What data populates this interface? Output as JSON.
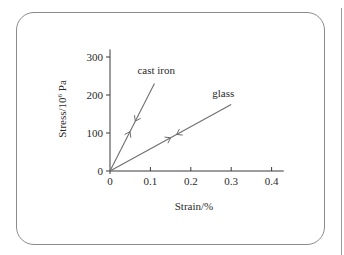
{
  "chart_data": {
    "type": "line",
    "title": "",
    "xlabel": "Strain/%",
    "ylabel": "Stress/10^6 Pa",
    "ylabel_display": {
      "base": "Stress/10",
      "sup": "6",
      "unit": " Pa"
    },
    "xlim": [
      0,
      0.43
    ],
    "ylim": [
      0,
      320
    ],
    "x_ticks": [
      "0",
      "0.1",
      "0.2",
      "0.3",
      "0.4"
    ],
    "y_ticks": [
      "0",
      "100",
      "200",
      "300"
    ],
    "grid": false,
    "legend": "inline labels",
    "series": [
      {
        "name": "cast iron",
        "points": [
          [
            0,
            0
          ],
          [
            0.11,
            230
          ]
        ],
        "arrows": [
          "loading (up)",
          "unloading (down)"
        ]
      },
      {
        "name": "glass",
        "points": [
          [
            0,
            0
          ],
          [
            0.3,
            175
          ]
        ],
        "arrows": [
          "loading (up)",
          "unloading (down)"
        ]
      }
    ]
  },
  "colors": {
    "axis": "#3a3a3a",
    "line": "#6e6e6e",
    "panel_border": "#8a8a8a"
  }
}
